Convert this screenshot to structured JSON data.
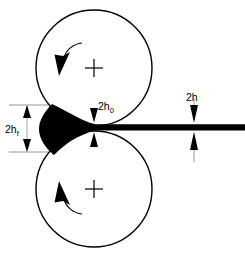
{
  "figure": {
    "background_color": "#ffffff",
    "ink_color": "#000000",
    "guide_color": "#8a8a8a",
    "width": 245,
    "height": 256
  },
  "rolls": {
    "top": {
      "name": "top-roll",
      "center_x": 94,
      "center_y": 68,
      "radius": 58,
      "rotation": "clockwise",
      "center_marker": "plus"
    },
    "bottom": {
      "name": "bottom-roll",
      "center_x": 94,
      "center_y": 189,
      "radius": 58,
      "rotation": "counter-clockwise",
      "center_marker": "plus"
    }
  },
  "workpiece": {
    "name": "rolled-strip",
    "color": "#000000",
    "entry_half_thickness_label": "2h",
    "nip_label": "2h",
    "exit_label": "2h"
  },
  "dimensions": [
    {
      "id": "entry-thickness",
      "base": "2h",
      "subscript": "f",
      "label": "2hf",
      "position": "left",
      "arrow_style": "double-inward",
      "top_y": 105,
      "bottom_y": 152,
      "x": 27,
      "text_x": 6,
      "text_y": 133
    },
    {
      "id": "nip-gap",
      "base": "2h",
      "subscript": "0",
      "label": "2h0",
      "position": "center",
      "arrow_style": "double-inward",
      "top_y": 104,
      "bottom_y": 154,
      "x": 94,
      "text_x": 99,
      "text_y": 110
    },
    {
      "id": "exit-thickness",
      "base": "2h",
      "subscript": "",
      "label": "2h",
      "position": "right",
      "arrow_style": "double-inward",
      "top_y": 100,
      "bottom_y": 160,
      "x": 194,
      "text_x": 187,
      "text_y": 102
    }
  ]
}
